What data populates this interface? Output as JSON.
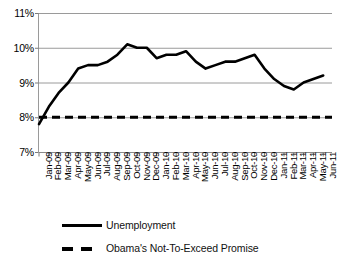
{
  "chart_data": {
    "type": "line",
    "title": "",
    "xlabel": "",
    "ylabel": "",
    "ylim": [
      7,
      11
    ],
    "ytick_labels": [
      "11%",
      "10%",
      "9%",
      "8%",
      "7%"
    ],
    "ytick_values": [
      11,
      10,
      9,
      8,
      7
    ],
    "grid": true,
    "legend_position": "bottom-left",
    "categories": [
      "Jan-09",
      "Feb-09",
      "Mar-09",
      "Apr-09",
      "May-09",
      "Jun-09",
      "Jul-09",
      "Aug-09",
      "Sep-09",
      "Oct-09",
      "Nov-09",
      "Dec-09",
      "Jan-10",
      "Feb-10",
      "Mar-10",
      "Apr-10",
      "May-10",
      "Jun-10",
      "Jul-10",
      "Aug-10",
      "Sep-10",
      "Oct-10",
      "Nov-10",
      "Dec-10",
      "Jan-11",
      "Feb-11",
      "Mar-11",
      "Apr-11",
      "May-11",
      "Jun-11"
    ],
    "series": [
      {
        "name": "Unemployment",
        "style": "solid",
        "color": "#000000",
        "values": [
          7.8,
          8.3,
          8.7,
          9.0,
          9.4,
          9.5,
          9.5,
          9.6,
          9.8,
          10.1,
          10.0,
          10.0,
          9.7,
          9.8,
          9.8,
          9.9,
          9.6,
          9.4,
          9.5,
          9.6,
          9.6,
          9.7,
          9.8,
          9.4,
          9.1,
          8.9,
          8.8,
          9.0,
          9.1,
          9.2
        ]
      },
      {
        "name": "Obama's Not-To-Exceed Promise",
        "style": "dashed",
        "color": "#000000",
        "constant_value": 8.0
      }
    ],
    "legend": [
      {
        "label": "Unemployment",
        "style": "solid"
      },
      {
        "label": "Obama's Not-To-Exceed Promise",
        "style": "dashed"
      }
    ]
  }
}
